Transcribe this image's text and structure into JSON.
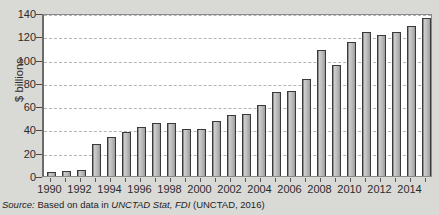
{
  "chart_data": {
    "type": "bar",
    "title": "",
    "subtitle": "",
    "xlabel": "",
    "ylabel": "$ billions",
    "ylim": [
      0,
      140
    ],
    "ytick_values": [
      0,
      20,
      40,
      60,
      80,
      100,
      120,
      140
    ],
    "ytick_labels": [
      "0",
      "20",
      "40",
      "60",
      "80",
      "100",
      "120",
      "140"
    ],
    "grid": true,
    "legend": null,
    "categories": [
      "1990",
      "1991",
      "1992",
      "1993",
      "1994",
      "1995",
      "1996",
      "1997",
      "1998",
      "1999",
      "2000",
      "2001",
      "2002",
      "2003",
      "2004",
      "2005",
      "2006",
      "2007",
      "2008",
      "2009",
      "2010",
      "2011",
      "2012",
      "2013",
      "2014",
      "2015"
    ],
    "values": [
      3.5,
      4.0,
      5.0,
      27.5,
      33.8,
      37.5,
      41.7,
      45.3,
      45.5,
      40.3,
      40.7,
      46.9,
      52.7,
      53.5,
      60.6,
      72.4,
      72.7,
      83.5,
      108.3,
      95.0,
      114.7,
      124.0,
      121.1,
      123.9,
      128.5,
      135.6
    ],
    "xtick_labels": [
      "1990",
      "1992",
      "1994",
      "1996",
      "1998",
      "2000",
      "2002",
      "2004",
      "2006",
      "2008",
      "2010",
      "2012",
      "2014"
    ],
    "xtick_categories": [
      "1990",
      "1992",
      "1994",
      "1996",
      "1998",
      "2000",
      "2002",
      "2004",
      "2006",
      "2008",
      "2010",
      "2012",
      "2014"
    ],
    "bar_color": "#b5b5b5",
    "bar_edge_color": "#3a3a3a",
    "grid_color": "#b4b4b4",
    "background_color": "#d9d9d6",
    "plot_background_color": "#ffffff"
  },
  "source_note": {
    "prefix": "Source:",
    "text_before": " Based on data in ",
    "italic_1": "UNCTAD Stat, FDI",
    "text_after": " (UNCTAD, 2016)",
    "full": "Source: Based on data in UNCTAD Stat, FDI (UNCTAD, 2016)"
  }
}
